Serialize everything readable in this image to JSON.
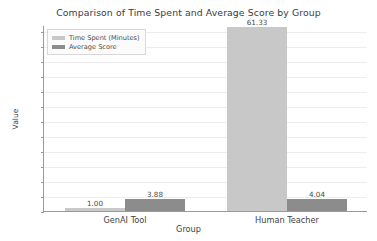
{
  "chart_data": {
    "type": "bar",
    "title": "Comparison of Time Spent and Average Score by Group",
    "xlabel": "Group",
    "ylabel": "Value",
    "categories": [
      "GenAI Tool",
      "Human Teacher"
    ],
    "series": [
      {
        "name": "Time Spent (Minutes)",
        "color": "#c8c8c8",
        "values": [
          1.0,
          61.33
        ],
        "labels": [
          "1.00",
          "61.33"
        ]
      },
      {
        "name": "Average Score",
        "color": "#8c8c8c",
        "values": [
          3.88,
          4.04
        ],
        "labels": [
          "3.88",
          "4.04"
        ]
      }
    ],
    "ylim": [
      0,
      62
    ],
    "yticks": [
      0,
      5,
      10,
      15,
      20,
      25,
      30,
      35,
      40,
      45,
      50,
      55,
      60
    ],
    "ytick_labels": [
      "0",
      "5",
      "10",
      "15",
      "20",
      "25",
      "30",
      "35",
      "40",
      "45",
      "50",
      "55",
      "60"
    ],
    "grid": true,
    "legend_position": "upper left"
  }
}
